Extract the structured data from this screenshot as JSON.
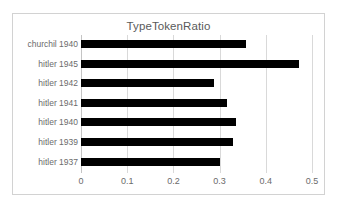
{
  "chart_data": {
    "type": "bar",
    "orientation": "horizontal",
    "title": "TypeTokenRatio",
    "xlabel": "",
    "ylabel": "",
    "categories": [
      "churchil 1940",
      "hitler 1945",
      "hitler 1942",
      "hitler 1941",
      "hitler 1940",
      "hitler 1939",
      "hitler 1937"
    ],
    "values": [
      0.357,
      0.471,
      0.287,
      0.315,
      0.335,
      0.328,
      0.3
    ],
    "xlim": [
      0,
      0.5
    ],
    "xticks": [
      0,
      0.1,
      0.2,
      0.3,
      0.4,
      0.5
    ],
    "xtick_labels": [
      "0",
      "0.1",
      "0.2",
      "0.3",
      "0.4",
      "0.5"
    ],
    "grid": "vertical",
    "legend": "none",
    "bar_color": "#000000",
    "gridline_color": "#d9d9d9",
    "text_color": "#6b6b6b",
    "frame_border_color": "#d2d2d2",
    "background": "#ffffff"
  }
}
